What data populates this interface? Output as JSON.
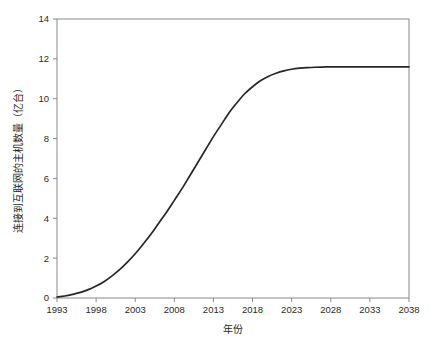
{
  "figure": {
    "background_color": "#ffffff",
    "width": 437,
    "height": 346
  },
  "chart_data": {
    "type": "line",
    "title": "",
    "subtitle": "",
    "xlabel": "年份",
    "ylabel": "连接到互联网的主机数量（亿台）",
    "xlim": [
      1993,
      2038
    ],
    "ylim": [
      0,
      14
    ],
    "xticks": [
      1993,
      1998,
      2003,
      2008,
      2013,
      2018,
      2023,
      2028,
      2033,
      2038
    ],
    "xtick_labels": [
      "1993",
      "1998",
      "2003",
      "2008",
      "2013",
      "2018",
      "2023",
      "2028",
      "2033",
      "2038"
    ],
    "yticks": [
      0,
      2,
      4,
      6,
      8,
      10,
      12,
      14
    ],
    "ytick_labels": [
      "0",
      "2",
      "4",
      "6",
      "8",
      "10",
      "12",
      "14"
    ],
    "grid": false,
    "legend": null,
    "legend_position": "none",
    "annotations": [],
    "series": [
      {
        "name": "连接到互联网的主机数量",
        "color": "#262626",
        "line_width": 1.7,
        "x": [
          1993,
          1994,
          1995,
          1996,
          1997,
          1998,
          1999,
          2000,
          2001,
          2002,
          2003,
          2004,
          2005,
          2006,
          2007,
          2008,
          2009,
          2010,
          2011,
          2012,
          2013,
          2014,
          2015,
          2016,
          2017,
          2018,
          2019,
          2020,
          2021,
          2022,
          2023,
          2024,
          2025,
          2026,
          2027,
          2028,
          2029,
          2030,
          2031,
          2032,
          2033,
          2034,
          2035,
          2036,
          2037,
          2038
        ],
        "y": [
          0.05,
          0.1,
          0.18,
          0.28,
          0.42,
          0.6,
          0.82,
          1.1,
          1.42,
          1.8,
          2.22,
          2.7,
          3.2,
          3.75,
          4.3,
          4.9,
          5.5,
          6.15,
          6.8,
          7.45,
          8.1,
          8.7,
          9.3,
          9.8,
          10.25,
          10.6,
          10.9,
          11.12,
          11.28,
          11.4,
          11.48,
          11.53,
          11.56,
          11.58,
          11.59,
          11.6,
          11.6,
          11.6,
          11.6,
          11.6,
          11.6,
          11.6,
          11.6,
          11.6,
          11.6,
          11.6
        ]
      }
    ]
  },
  "axes": {
    "frame_color": "#8a8a8a",
    "tick_color": "#8a8a8a",
    "label_color": "#2b2b2b"
  }
}
